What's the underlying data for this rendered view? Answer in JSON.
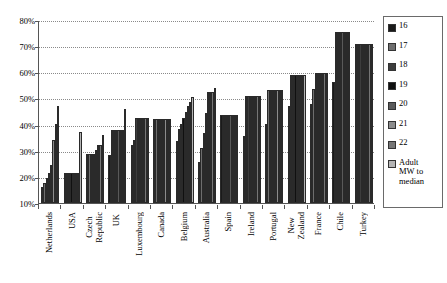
{
  "chart_data": {
    "type": "bar",
    "title": "",
    "xlabel": "",
    "ylabel": "",
    "ylim": [
      10,
      80
    ],
    "ytick_labels": [
      "10%",
      "20%",
      "30%",
      "40%",
      "50%",
      "60%",
      "70%",
      "80%"
    ],
    "ytick_values": [
      10,
      20,
      30,
      40,
      50,
      60,
      70,
      80
    ],
    "grid": true,
    "legend_position": "right",
    "categories": [
      "Netherlands",
      "USA",
      "Czech\nRepublic",
      "UK",
      "Luxembourg",
      "Canada",
      "Belgium",
      "Australia",
      "Spain",
      "Ireland",
      "Portugal",
      "New\nZealand",
      "France",
      "Chile",
      "Turkey"
    ],
    "series": [
      {
        "name": "16",
        "color": "#1a1a1a",
        "values": [
          16.3,
          21.5,
          28.8,
          28.4,
          32.1,
          42.3,
          33.9,
          25.6,
          43.8,
          35.5,
          40.1,
          47.3,
          47.8,
          56.4,
          70.9
        ]
      },
      {
        "name": "17",
        "color": "#6e6e6e",
        "values": [
          17.8,
          21.5,
          28.8,
          38.1,
          34.0,
          42.3,
          38.4,
          31.2,
          43.8,
          50.8,
          53.2,
          59.0,
          53.6,
          75.5,
          70.9
        ]
      },
      {
        "name": "18",
        "color": "#3d3d3d",
        "values": [
          19.5,
          21.5,
          28.8,
          38.1,
          42.6,
          42.3,
          40.3,
          36.8,
          43.8,
          50.8,
          53.2,
          59.0,
          59.7,
          75.5,
          70.9
        ]
      },
      {
        "name": "19",
        "color": "#101010",
        "values": [
          21.6,
          21.5,
          28.8,
          38.1,
          42.6,
          42.3,
          42.4,
          44.5,
          43.8,
          50.8,
          53.2,
          59.0,
          59.7,
          75.5,
          70.9
        ]
      },
      {
        "name": "20",
        "color": "#5a5a5a",
        "values": [
          24.7,
          21.5,
          30.1,
          38.1,
          42.6,
          42.3,
          44.8,
          52.5,
          43.8,
          50.8,
          53.2,
          59.0,
          59.7,
          75.5,
          70.9
        ]
      },
      {
        "name": "21",
        "color": "#8c8c8c",
        "values": [
          34.2,
          21.5,
          32.2,
          38.1,
          42.6,
          42.3,
          47.1,
          52.5,
          43.8,
          50.8,
          53.2,
          59.0,
          59.7,
          75.5,
          70.9
        ]
      },
      {
        "name": "22",
        "color": "#767676",
        "values": [
          40.3,
          21.5,
          32.2,
          38.1,
          42.6,
          42.3,
          48.8,
          52.5,
          43.8,
          50.8,
          53.2,
          59.0,
          59.7,
          75.5,
          70.9
        ]
      },
      {
        "name": "Adult\nMW to\nmedian",
        "color": "#b5b5b5",
        "values": [
          47.0,
          37.0,
          35.9,
          46.0,
          42.6,
          42.3,
          50.5,
          53.9,
          43.8,
          50.8,
          53.2,
          59.0,
          59.7,
          75.5,
          70.9
        ]
      }
    ]
  },
  "legend": {
    "items": [
      {
        "label": "16",
        "color": "#1a1a1a"
      },
      {
        "label": "17",
        "color": "#6e6e6e"
      },
      {
        "label": "18",
        "color": "#3d3d3d"
      },
      {
        "label": "19",
        "color": "#101010"
      },
      {
        "label": "20",
        "color": "#5a5a5a"
      },
      {
        "label": "21",
        "color": "#8c8c8c"
      },
      {
        "label": "22",
        "color": "#767676"
      },
      {
        "label": "Adult\nMW to\nmedian",
        "color": "#b5b5b5"
      }
    ]
  },
  "top_fragment": ""
}
